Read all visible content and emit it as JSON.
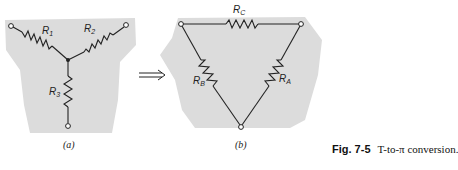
{
  "figure": {
    "number": "Fig. 7-5",
    "caption": "T-to-π conversion."
  },
  "panel_a": {
    "label": "(a)",
    "resistors": [
      {
        "name": "R",
        "sub": "1"
      },
      {
        "name": "R",
        "sub": "2"
      },
      {
        "name": "R",
        "sub": "3"
      }
    ]
  },
  "panel_b": {
    "label": "(b)",
    "resistors": [
      {
        "name": "R",
        "sub": "C"
      },
      {
        "name": "R",
        "sub": "B"
      },
      {
        "name": "R",
        "sub": "A"
      }
    ]
  },
  "arrow": {
    "symbol": "⇒"
  },
  "colors": {
    "shade": "#d9d9d9",
    "line": "#222222"
  }
}
